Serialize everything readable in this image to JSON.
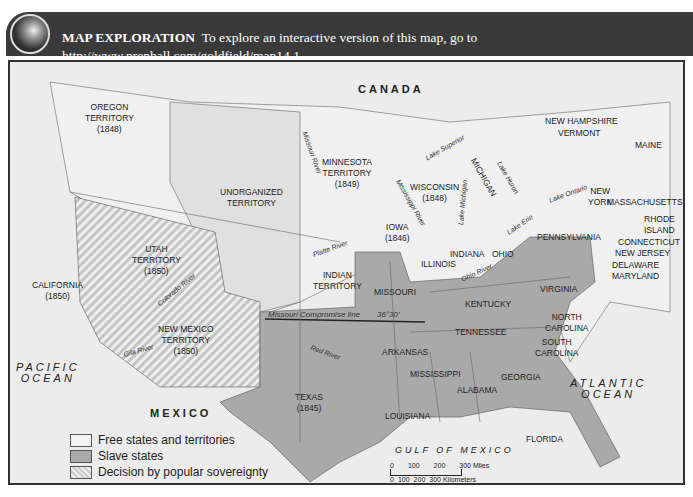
{
  "header": {
    "lead": "MAP EXPLORATION",
    "text": "To explore an interactive version of this map, go to",
    "url": "http://www.prenhall.com/goldfield/map14.1",
    "icon": "globe-icon"
  },
  "map": {
    "regions": {
      "canada": "CANADA",
      "mexico": "MEXICO",
      "pacific1": "PACIFIC",
      "pacific2": "OCEAN",
      "atlantic1": "ATLANTIC",
      "atlantic2": "OCEAN",
      "gulf": "GULF OF MEXICO"
    },
    "territories": [
      {
        "name": "OREGON",
        "line2": "TERRITORY",
        "year": "(1848)"
      },
      {
        "name": "UNORGANIZED",
        "line2": "TERRITORY"
      },
      {
        "name": "MINNESOTA",
        "line2": "TERRITORY",
        "year": "(1849)"
      },
      {
        "name": "UTAH",
        "line2": "TERRITORY",
        "year": "(1850)"
      },
      {
        "name": "NEW MEXICO",
        "line2": "TERRITORY",
        "year": "(1850)"
      },
      {
        "name": "INDIAN",
        "line2": "TERRITORY"
      }
    ],
    "states": {
      "california": "CALIFORNIA",
      "california_year": "(1850)",
      "texas": "TEXAS",
      "texas_year": "(1845)",
      "iowa": "IOWA",
      "iowa_year": "(1846)",
      "wisconsin": "WISCONSIN",
      "wisconsin_year": "(1848)",
      "michigan": "MICHIGAN",
      "illinois": "ILLINOIS",
      "indiana": "INDIANA",
      "ohio": "OHIO",
      "missouri": "MISSOURI",
      "kentucky": "KENTUCKY",
      "virginia": "VIRGINIA",
      "tennessee": "TENNESSEE",
      "north_carolina_1": "NORTH",
      "north_carolina_2": "CAROLINA",
      "south_carolina_1": "SOUTH",
      "south_carolina_2": "CAROLINA",
      "arkansas": "ARKANSAS",
      "mississippi": "MISSISSIPPI",
      "alabama": "ALABAMA",
      "georgia": "GEORGIA",
      "louisiana": "LOUISIANA",
      "florida": "FLORIDA",
      "pennsylvania": "PENNSYLVANIA",
      "new_york_1": "NEW",
      "new_york_2": "YORK",
      "new_hampshire": "NEW HAMPSHIRE",
      "vermont": "VERMONT",
      "maine": "MAINE",
      "massachusetts": "MASSACHUSETTS",
      "rhode_island_1": "RHODE",
      "rhode_island_2": "ISLAND",
      "connecticut": "CONNECTICUT",
      "new_jersey": "NEW JERSEY",
      "delaware": "DELAWARE",
      "maryland": "MARYLAND"
    },
    "features": {
      "missouri_river": "Missouri River",
      "mississippi_river": "Mississippi River",
      "platte_river": "Platte River",
      "colorado_river": "Colorado River",
      "gila_river": "Gila River",
      "red_river": "Red River",
      "ohio_river": "Ohio River",
      "lake_superior": "Lake Superior",
      "lake_michigan": "Lake Michigan",
      "lake_huron": "Lake Huron",
      "lake_ontario": "Lake Ontario",
      "lake_erie": "Lake Erie",
      "compromise_line": "Missouri Compromise line",
      "compromise_lat": "36°30'"
    },
    "colors": {
      "free": "#f3f3f3",
      "slave": "#a9a9a9",
      "popular": "#d0d0d0",
      "background": "#ececec"
    }
  },
  "legend": {
    "items": [
      {
        "label": "Free states and territories",
        "key": "free"
      },
      {
        "label": "Slave states",
        "key": "slave"
      },
      {
        "label": "Decision by popular sovereignty",
        "key": "popular"
      }
    ]
  },
  "scale": {
    "miles": [
      "0",
      "100",
      "200",
      "300 Miles"
    ],
    "km": [
      "0",
      "100",
      "200",
      "300 Kilometers"
    ]
  }
}
